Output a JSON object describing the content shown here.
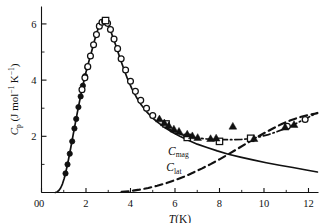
{
  "figure": {
    "name": "heat-capacity-vs-temperature",
    "background": "#ffffff",
    "ink": "#111111"
  },
  "chart_data": {
    "type": "line",
    "title": "",
    "xlabel": "T(K)",
    "ylabel": "C_p (J mol^-1 K^-1)",
    "ylabel_parts": {
      "symbol": "C",
      "symbol_sub": "p",
      "units_open": "(J mol",
      "sup1": "−1",
      "units_mid": " K",
      "sup2": "−1",
      "units_close": ")"
    },
    "xlabel_parts": {
      "symbol": "T",
      "units": "(K)"
    },
    "xlim": [
      0,
      12.45
    ],
    "ylim": [
      0,
      6.62
    ],
    "xticks": [
      0,
      2,
      4,
      6,
      8,
      10,
      12
    ],
    "xticklabels": [
      "0",
      "2",
      "4",
      "6",
      "8",
      "10",
      "12"
    ],
    "xminorticks": [
      1,
      3,
      5,
      7,
      9,
      11
    ],
    "yticks": [
      0,
      2,
      4,
      6
    ],
    "yticklabels": [
      "",
      "2",
      "4",
      "6"
    ],
    "yminorticks": [
      1,
      3,
      5
    ],
    "grid": false,
    "legend": "inline-annotations",
    "annotations": [
      {
        "text": "C",
        "sub": "mag",
        "x": 6.15,
        "y": 1.35,
        "name": "curve-label-cmag"
      },
      {
        "text": "C",
        "sub": "lat",
        "x": 5.95,
        "y": 0.75,
        "name": "curve-label-clat"
      }
    ],
    "series": [
      {
        "name": "C_mag",
        "label": "magnetic contribution",
        "style": "solid",
        "color": "#111111",
        "points": [
          [
            0.62,
            0.0
          ],
          [
            0.7,
            0.02
          ],
          [
            0.78,
            0.07
          ],
          [
            0.86,
            0.16
          ],
          [
            0.94,
            0.3
          ],
          [
            1.02,
            0.5
          ],
          [
            1.1,
            0.75
          ],
          [
            1.18,
            1.04
          ],
          [
            1.26,
            1.36
          ],
          [
            1.34,
            1.7
          ],
          [
            1.42,
            2.04
          ],
          [
            1.5,
            2.38
          ],
          [
            1.58,
            2.72
          ],
          [
            1.66,
            3.05
          ],
          [
            1.74,
            3.36
          ],
          [
            1.82,
            3.66
          ],
          [
            1.9,
            3.95
          ],
          [
            1.98,
            4.22
          ],
          [
            2.06,
            4.47
          ],
          [
            2.14,
            4.7
          ],
          [
            2.22,
            4.92
          ],
          [
            2.3,
            5.16
          ],
          [
            2.38,
            5.4
          ],
          [
            2.46,
            5.62
          ],
          [
            2.54,
            5.82
          ],
          [
            2.62,
            5.96
          ],
          [
            2.7,
            6.06
          ],
          [
            2.78,
            6.1
          ],
          [
            2.86,
            6.08
          ],
          [
            2.94,
            6.02
          ],
          [
            3.02,
            5.9
          ],
          [
            3.12,
            5.72
          ],
          [
            3.24,
            5.46
          ],
          [
            3.38,
            5.14
          ],
          [
            3.52,
            4.8
          ],
          [
            3.68,
            4.44
          ],
          [
            3.86,
            4.06
          ],
          [
            4.06,
            3.7
          ],
          [
            4.26,
            3.4
          ],
          [
            4.48,
            3.12
          ],
          [
            4.72,
            2.88
          ],
          [
            4.98,
            2.66
          ],
          [
            5.26,
            2.48
          ],
          [
            5.56,
            2.3
          ],
          [
            5.88,
            2.14
          ],
          [
            6.22,
            2.0
          ],
          [
            6.6,
            1.86
          ],
          [
            7.0,
            1.72
          ],
          [
            7.44,
            1.6
          ],
          [
            7.9,
            1.48
          ],
          [
            8.4,
            1.36
          ],
          [
            8.94,
            1.26
          ],
          [
            9.5,
            1.16
          ],
          [
            10.1,
            1.06
          ],
          [
            10.7,
            0.97
          ],
          [
            11.3,
            0.89
          ],
          [
            11.9,
            0.8
          ],
          [
            12.4,
            0.73
          ]
        ]
      },
      {
        "name": "C_lat",
        "label": "lattice contribution",
        "style": "dashed",
        "color": "#111111",
        "points": [
          [
            3.6,
            0.02
          ],
          [
            4.0,
            0.05
          ],
          [
            4.4,
            0.1
          ],
          [
            4.8,
            0.16
          ],
          [
            5.2,
            0.24
          ],
          [
            5.6,
            0.33
          ],
          [
            6.0,
            0.44
          ],
          [
            6.4,
            0.56
          ],
          [
            6.8,
            0.7
          ],
          [
            7.2,
            0.85
          ],
          [
            7.6,
            1.01
          ],
          [
            8.0,
            1.18
          ],
          [
            8.4,
            1.36
          ],
          [
            8.8,
            1.55
          ],
          [
            9.2,
            1.74
          ],
          [
            9.6,
            1.93
          ],
          [
            10.0,
            2.11
          ],
          [
            10.4,
            2.28
          ],
          [
            10.8,
            2.44
          ],
          [
            11.2,
            2.57
          ],
          [
            11.6,
            2.68
          ],
          [
            12.0,
            2.76
          ],
          [
            12.4,
            2.82
          ]
        ]
      },
      {
        "name": "C_total",
        "label": "total (magnetic + lattice)",
        "style": "dash-dot",
        "color": "#111111",
        "points": [
          [
            5.55,
            2.33
          ],
          [
            5.9,
            2.19
          ],
          [
            6.25,
            2.07
          ],
          [
            6.6,
            1.99
          ],
          [
            7.0,
            1.94
          ],
          [
            7.4,
            1.91
          ],
          [
            7.8,
            1.89
          ],
          [
            8.2,
            1.88
          ],
          [
            8.6,
            1.88
          ],
          [
            9.0,
            1.89
          ],
          [
            9.4,
            1.92
          ],
          [
            9.8,
            1.98
          ],
          [
            10.2,
            2.06
          ],
          [
            10.6,
            2.17
          ],
          [
            11.0,
            2.29
          ],
          [
            11.4,
            2.44
          ],
          [
            11.8,
            2.6
          ],
          [
            12.2,
            2.76
          ],
          [
            12.4,
            2.84
          ]
        ]
      }
    ],
    "marker_series": [
      {
        "name": "filled-circles",
        "marker": "filled-circle",
        "size": 3.2,
        "points": [
          [
            1.08,
            0.68
          ],
          [
            1.17,
            1.0
          ],
          [
            1.27,
            1.38
          ],
          [
            1.38,
            1.82
          ],
          [
            1.48,
            2.28
          ],
          [
            1.56,
            2.62
          ],
          [
            1.66,
            3.04
          ],
          [
            1.76,
            3.42
          ],
          [
            1.86,
            3.8
          ],
          [
            1.96,
            4.14
          ],
          [
            2.06,
            4.46
          ]
        ]
      },
      {
        "name": "open-circles",
        "marker": "open-circle",
        "size": 3.4,
        "points": [
          [
            1.82,
            3.66
          ],
          [
            1.95,
            4.08
          ],
          [
            2.08,
            4.48
          ],
          [
            2.2,
            4.86
          ],
          [
            2.34,
            5.26
          ],
          [
            2.47,
            5.62
          ],
          [
            2.6,
            5.92
          ],
          [
            2.72,
            6.06
          ],
          [
            2.84,
            6.1
          ],
          [
            2.97,
            6.02
          ],
          [
            3.1,
            5.8
          ],
          [
            3.26,
            5.46
          ],
          [
            3.42,
            5.12
          ],
          [
            3.58,
            4.76
          ],
          [
            3.78,
            4.36
          ],
          [
            4.0,
            3.96
          ],
          [
            4.22,
            3.6
          ],
          [
            4.46,
            3.28
          ],
          [
            4.72,
            3.0
          ],
          [
            5.0,
            2.74
          ],
          [
            11.05,
            2.36
          ],
          [
            11.85,
            2.6
          ]
        ]
      },
      {
        "name": "open-squares",
        "marker": "open-square",
        "size": 3.6,
        "points": [
          [
            2.88,
            6.12
          ],
          [
            5.6,
            2.44
          ],
          [
            6.55,
            1.96
          ],
          [
            8.0,
            1.82
          ],
          [
            9.4,
            1.93
          ]
        ]
      },
      {
        "name": "filled-triangles",
        "marker": "filled-triangle",
        "size": 4.0,
        "points": [
          [
            5.3,
            2.62
          ],
          [
            5.52,
            2.48
          ],
          [
            5.72,
            2.38
          ],
          [
            5.95,
            2.26
          ],
          [
            6.18,
            2.18
          ],
          [
            6.55,
            2.08
          ],
          [
            6.78,
            2.02
          ],
          [
            7.02,
            1.96
          ],
          [
            7.6,
            1.92
          ],
          [
            7.85,
            1.94
          ],
          [
            8.6,
            2.36
          ],
          [
            9.55,
            1.92
          ],
          [
            10.95,
            2.33
          ],
          [
            11.35,
            2.42
          ]
        ]
      }
    ]
  }
}
